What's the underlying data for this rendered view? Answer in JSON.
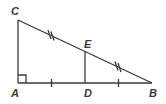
{
  "diagram": {
    "type": "geometry-triangle",
    "colors": {
      "stroke": "#3a3a3a",
      "background": "#ffffff"
    },
    "points": {
      "A": {
        "label": "A",
        "x": 18,
        "y": 83
      },
      "B": {
        "label": "B",
        "x": 152,
        "y": 83
      },
      "C": {
        "label": "C",
        "x": 18,
        "y": 20
      },
      "D": {
        "label": "D",
        "x": 85,
        "y": 83
      },
      "E": {
        "label": "E",
        "x": 85,
        "y": 51
      }
    },
    "segments": [
      "AC",
      "CB",
      "AB",
      "DE"
    ],
    "right_angle_at": "A",
    "tick_marks": {
      "single": [
        "AD",
        "DB"
      ],
      "double": [
        "CE",
        "EB"
      ]
    }
  }
}
